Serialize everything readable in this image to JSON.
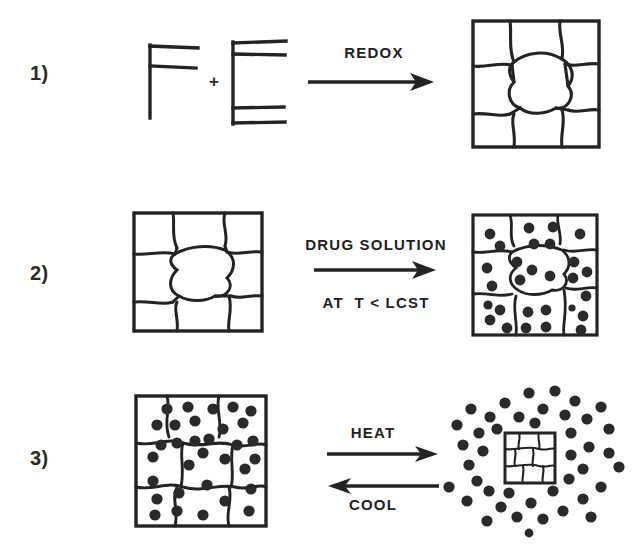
{
  "figure": {
    "background_color": "#ffffff",
    "ink_color": "#232323",
    "particle_color": "#2a2a2a"
  },
  "steps": [
    {
      "id": "step-1",
      "number": "1)",
      "reagent_left_icon": "polymer-backbone-f-icon",
      "plus_sign": "+",
      "reagent_right_icon": "crosslinker-e-icon",
      "arrow": {
        "type": "single-right",
        "above_label": "REDOX",
        "below_label": ""
      },
      "product_icon": "hydrogel-network-empty-icon"
    },
    {
      "id": "step-2",
      "number": "2)",
      "reactant_icon": "hydrogel-network-empty-icon",
      "arrow": {
        "type": "single-right",
        "above_label": "DRUG SOLUTION",
        "below_label": "AT  T < LCST"
      },
      "product_icon": "hydrogel-network-loaded-icon"
    },
    {
      "id": "step-3",
      "number": "3)",
      "reactant_icon": "hydrogel-network-loaded-icon",
      "arrow": {
        "type": "reversible",
        "above_label": "HEAT",
        "below_label": "COOL"
      },
      "product_icon": "collapsed-gel-released-drug-icon"
    }
  ]
}
